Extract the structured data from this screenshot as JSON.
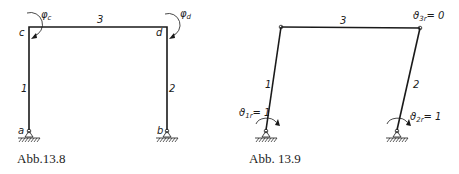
{
  "figures": [
    {
      "caption": "Abb.13.8",
      "members": [
        {
          "id": "1",
          "label": "1"
        },
        {
          "id": "2",
          "label": "2"
        },
        {
          "id": "3",
          "label": "3"
        }
      ],
      "nodes": [
        {
          "id": "a",
          "label": "a"
        },
        {
          "id": "b",
          "label": "b"
        },
        {
          "id": "c",
          "label": "c"
        },
        {
          "id": "d",
          "label": "d"
        }
      ],
      "rotations": [
        {
          "symbol": "φ",
          "sub": "c"
        },
        {
          "symbol": "φ",
          "sub": "d"
        }
      ]
    },
    {
      "caption": "Abb. 13.9",
      "members": [
        {
          "id": "1",
          "label": "1"
        },
        {
          "id": "2",
          "label": "2"
        },
        {
          "id": "3",
          "label": "3"
        }
      ],
      "annotations": [
        {
          "symbol": "ϑ",
          "sub": "3r",
          "value": "= 0"
        },
        {
          "symbol": "ϑ",
          "sub": "1r",
          "value": "= 1"
        },
        {
          "symbol": "ϑ",
          "sub": "2r",
          "value": "= 1"
        }
      ]
    }
  ],
  "colors": {
    "line": "#1a1a1a",
    "background": "#ffffff"
  }
}
